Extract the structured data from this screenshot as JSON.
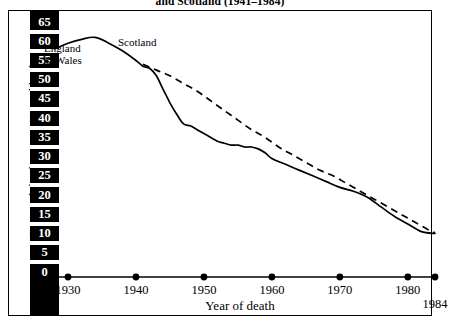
{
  "figure": {
    "title": "and Scotland (1941–1984)",
    "axis_caption": "Year of death",
    "y_axis_title": "Perinatal deaths per 1000 total births"
  },
  "labels": {
    "england_wales": "England\n& Wales",
    "england_line1": "England",
    "england_line2": "& Wales",
    "scotland": "Scotland"
  },
  "chart_data": {
    "type": "line",
    "title": "and Scotland (1941–1984)",
    "xlabel": "Year of death",
    "ylabel": "Perinatal deaths per 1000 total births",
    "xlim": [
      1928,
      1984
    ],
    "ylim": [
      0,
      65
    ],
    "grid": false,
    "legend": "inline-annotations",
    "x_ticks": [
      "1930",
      "1940",
      "1950",
      "1960",
      "1970",
      "1980",
      "1984"
    ],
    "x_tick_values": [
      1930,
      1940,
      1950,
      1960,
      1970,
      1980,
      1984
    ],
    "y_ticks": [
      "0",
      "5",
      "10",
      "15",
      "20",
      "25",
      "30",
      "35",
      "40",
      "45",
      "50",
      "55",
      "60",
      "65"
    ],
    "y_tick_values": [
      0,
      5,
      10,
      15,
      20,
      25,
      30,
      35,
      40,
      45,
      50,
      55,
      60,
      65
    ],
    "series": [
      {
        "name": "England & Wales",
        "style": "solid",
        "color": "#000000",
        "x": [
          1928,
          1930,
          1932,
          1934,
          1936,
          1938,
          1940,
          1941,
          1942,
          1943,
          1944,
          1945,
          1946,
          1947,
          1948,
          1949,
          1950,
          1951,
          1952,
          1953,
          1954,
          1955,
          1956,
          1957,
          1958,
          1959,
          1960,
          1962,
          1964,
          1966,
          1968,
          1970,
          1972,
          1974,
          1976,
          1978,
          1980,
          1982,
          1984
        ],
        "values": [
          58.0,
          59.5,
          60.5,
          61.0,
          59.5,
          57.5,
          55.0,
          53.5,
          53.0,
          51.0,
          47.5,
          44.0,
          41.0,
          38.5,
          38.0,
          37.0,
          36.0,
          35.0,
          34.0,
          33.5,
          33.0,
          33.0,
          32.5,
          32.5,
          32.0,
          31.0,
          29.5,
          28.0,
          26.5,
          25.0,
          23.5,
          22.0,
          21.0,
          19.5,
          17.0,
          14.5,
          12.5,
          10.5,
          10.0
        ]
      },
      {
        "name": "Scotland",
        "style": "dashed",
        "color": "#000000",
        "x": [
          1941,
          1943,
          1945,
          1947,
          1949,
          1951,
          1953,
          1955,
          1957,
          1959,
          1961,
          1963,
          1965,
          1967,
          1969,
          1971,
          1973,
          1975,
          1977,
          1979,
          1981,
          1983,
          1984
        ],
        "values": [
          54.0,
          52.5,
          51.0,
          49.0,
          47.0,
          44.5,
          42.0,
          39.5,
          37.0,
          35.0,
          32.5,
          30.5,
          28.5,
          26.5,
          25.0,
          23.0,
          21.0,
          19.0,
          17.0,
          15.0,
          13.0,
          11.0,
          10.2
        ]
      }
    ],
    "annotations": [
      {
        "text": "England & Wales",
        "x": 1929,
        "y": 55
      },
      {
        "text": "Scotland",
        "x": 1941,
        "y": 58
      }
    ]
  }
}
